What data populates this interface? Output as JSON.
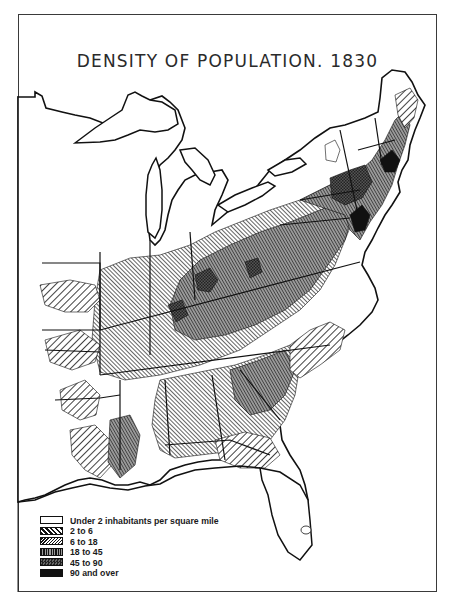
{
  "map": {
    "title": "DENSITY OF POPULATION. 1830",
    "region": "Eastern United States",
    "colors": {
      "ink": "#111111",
      "paper": "#ffffff",
      "frame": "#3a3a3a"
    }
  },
  "legend": {
    "items": [
      {
        "label": "Under 2 inhabitants per square mile",
        "pattern": "blank",
        "fill": "#ffffff"
      },
      {
        "label": "2 to 6",
        "pattern": "wide-diagonal-hatch",
        "fill": "#cfcfcf"
      },
      {
        "label": "6 to 18",
        "pattern": "fine-diagonal-hatch",
        "fill": "#a9a9a9"
      },
      {
        "label": "18 to 45",
        "pattern": "vertical-lines",
        "fill": "#7a7a7a"
      },
      {
        "label": "45 to 90",
        "pattern": "crosshatch",
        "fill": "#4a4a4a"
      },
      {
        "label": "90 and over",
        "pattern": "solid",
        "fill": "#111111"
      }
    ]
  }
}
